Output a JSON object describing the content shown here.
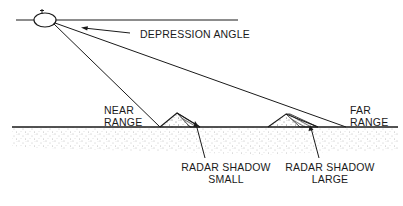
{
  "diagram": {
    "labels": {
      "depression_angle": "DEPRESSION ANGLE",
      "near_range_line1": "NEAR",
      "near_range_line2": "RANGE",
      "far_range_line1": "FAR",
      "far_range_line2": "RANGE",
      "shadow_small_line1": "RADAR SHADOW",
      "shadow_small_line2": "SMALL",
      "shadow_large_line1": "RADAR SHADOW",
      "shadow_large_line2": "LARGE"
    },
    "elements": {
      "aircraft_icon": "aircraft-ellipse-icon",
      "terrain": "stippled-ground",
      "hills": [
        "small-hill",
        "large-hill"
      ]
    },
    "colors": {
      "ink": "#1a1a1a",
      "background": "#ffffff",
      "stipple": "#6b6b6b"
    }
  }
}
